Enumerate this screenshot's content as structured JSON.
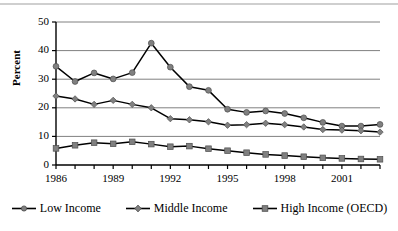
{
  "chart_data": {
    "type": "line",
    "title": "",
    "xlabel": "",
    "ylabel": "Percent",
    "ylim": [
      0,
      50
    ],
    "yticks": [
      0,
      10,
      20,
      30,
      40,
      50
    ],
    "xlim": [
      1986,
      2003
    ],
    "x": [
      1986,
      1987,
      1988,
      1989,
      1990,
      1991,
      1992,
      1993,
      1994,
      1995,
      1996,
      1997,
      1998,
      1999,
      2000,
      2001,
      2002,
      2003
    ],
    "xticks": [
      1986,
      1987,
      1988,
      1989,
      1990,
      1991,
      1992,
      1993,
      1994,
      1995,
      1996,
      1997,
      1998,
      1999,
      2000,
      2001,
      2002,
      2003
    ],
    "xtick_labels_shown": [
      "1986",
      "1989",
      "1992",
      "1995",
      "1998",
      "2001"
    ],
    "xtick_labels_shown_values": [
      1986,
      1989,
      1992,
      1995,
      1998,
      2001
    ],
    "grid": true,
    "grid_axis": "y",
    "legend_position": "bottom",
    "series": [
      {
        "name": "Low Income",
        "marker": "circle",
        "color": "#808080",
        "line_color": "#000000",
        "values": [
          34.5,
          29.2,
          32.2,
          30.1,
          32.3,
          42.6,
          34.2,
          27.4,
          26.1,
          19.5,
          18.4,
          18.9,
          18.0,
          16.5,
          14.9,
          13.6,
          13.6,
          14.2
        ]
      },
      {
        "name": "Middle Income",
        "marker": "diamond",
        "color": "#808080",
        "line_color": "#000000",
        "values": [
          24.1,
          23.1,
          21.2,
          22.6,
          21.2,
          20.0,
          16.2,
          15.8,
          15.1,
          13.9,
          14.1,
          14.6,
          14.1,
          13.3,
          12.4,
          12.2,
          12.0,
          11.5
        ]
      },
      {
        "name": "High Income (OECD)",
        "marker": "square",
        "color": "#808080",
        "line_color": "#000000",
        "values": [
          5.8,
          6.9,
          7.8,
          7.4,
          8.1,
          7.3,
          6.4,
          6.6,
          5.7,
          5.0,
          4.3,
          3.7,
          3.3,
          2.9,
          2.5,
          2.3,
          2.1,
          2.0
        ]
      }
    ]
  },
  "legend": {
    "items": [
      {
        "label": "Low Income",
        "marker": "circle"
      },
      {
        "label": "Middle Income",
        "marker": "diamond"
      },
      {
        "label": "High Income (OECD)",
        "marker": "square"
      }
    ]
  },
  "colors": {
    "marker_fill": "#808080",
    "line": "#000000",
    "grid": "#808080",
    "axis": "#000000",
    "background": "#ffffff",
    "frame": "#cfcfcf"
  }
}
